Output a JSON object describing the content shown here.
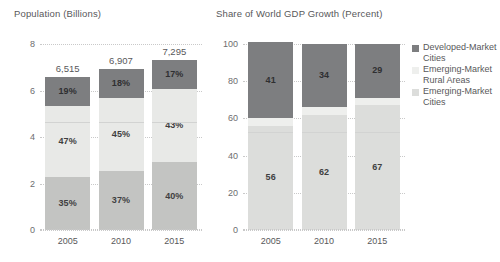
{
  "chart_data": [
    {
      "id": "population",
      "type": "bar",
      "title": "Population (Billions)",
      "xlabel": "",
      "ylabel": "",
      "categories": [
        "2005",
        "2010",
        "2015"
      ],
      "ylim": [
        0,
        8
      ],
      "yticks": [
        0,
        2,
        4,
        6,
        8
      ],
      "grid": true,
      "stacked": true,
      "units": "billions",
      "totals": [
        "6,515",
        "6,907",
        "7,295"
      ],
      "totals_values": [
        6515,
        6907,
        7295
      ],
      "totals_units": "millions of people",
      "series": [
        {
          "name": "Emerging-Market Cities",
          "color": "#c3c4c2",
          "values": [
            35,
            37,
            40
          ],
          "labels": [
            "35%",
            "37%",
            "40%"
          ]
        },
        {
          "name": "Emerging-Market Rural Areas",
          "color": "#e8e9e7",
          "values": [
            47,
            45,
            43
          ],
          "labels": [
            "47%",
            "45%",
            "43%"
          ]
        },
        {
          "name": "Developed-Market Cities",
          "color": "#7d7e80",
          "values": [
            19,
            18,
            17
          ],
          "labels": [
            "19%",
            "18%",
            "17%"
          ]
        }
      ]
    },
    {
      "id": "gdp-share",
      "type": "bar",
      "title": "Share of World GDP Growth (Percent)",
      "xlabel": "",
      "ylabel": "",
      "categories": [
        "2005",
        "2010",
        "2015"
      ],
      "ylim": [
        0,
        100
      ],
      "yticks": [
        0,
        20,
        40,
        60,
        80,
        100
      ],
      "grid": true,
      "stacked": true,
      "units": "percent",
      "series": [
        {
          "name": "Emerging-Market Cities",
          "color": "#dcdddb",
          "values": [
            56,
            62,
            67
          ],
          "labels": [
            "56",
            "62",
            "67"
          ]
        },
        {
          "name": "Emerging-Market Rural Areas",
          "color": "#eeefed",
          "values": [
            4,
            4,
            4
          ],
          "labels": [
            "4",
            "4",
            "4"
          ]
        },
        {
          "name": "Developed-Market Cities",
          "color": "#7d7e80",
          "values": [
            41,
            34,
            29
          ],
          "labels": [
            "41",
            "34",
            "29"
          ]
        }
      ]
    }
  ],
  "legend": {
    "position": "right",
    "items": [
      {
        "label": "Developed-Market Cities",
        "color": "#7d7e80"
      },
      {
        "label": "Emerging-Market Rural Areas",
        "color": "#eeefed"
      },
      {
        "label": "Emerging-Market Cities",
        "color": "#dcdddb"
      }
    ]
  },
  "axes": {
    "left": {
      "yticks": [
        "8",
        "6",
        "4",
        "2",
        "0"
      ],
      "xticks": [
        "2005",
        "2010",
        "2015"
      ]
    },
    "right": {
      "yticks": [
        "100",
        "80",
        "60",
        "40",
        "20",
        "0"
      ],
      "xticks": [
        "2005",
        "2010",
        "2015"
      ]
    }
  }
}
